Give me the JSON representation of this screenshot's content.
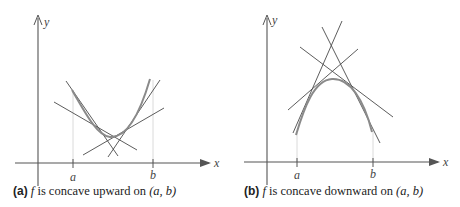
{
  "colors": {
    "axis": "#555555",
    "tangent": "#4a4a4a",
    "curve": "#8a8a8a",
    "guide": "#cfcfcf",
    "text": "#222222"
  },
  "panels": [
    {
      "id": "a",
      "caption": {
        "tag": "(a)",
        "func": "f",
        "text": " is concave upward on ",
        "interval": "(a, b)"
      },
      "axis_labels": {
        "x": "x",
        "y": "y"
      },
      "ticks": [
        {
          "label": "a"
        },
        {
          "label": "b"
        }
      ],
      "description": "Concave-up curve lying above its tangent lines"
    },
    {
      "id": "b",
      "caption": {
        "tag": "(b)",
        "func": "f",
        "text": " is concave downward on ",
        "interval": "(a, b)"
      },
      "axis_labels": {
        "x": "x",
        "y": "y"
      },
      "ticks": [
        {
          "label": "a"
        },
        {
          "label": "b"
        }
      ],
      "description": "Concave-down curve lying below its tangent lines"
    }
  ]
}
